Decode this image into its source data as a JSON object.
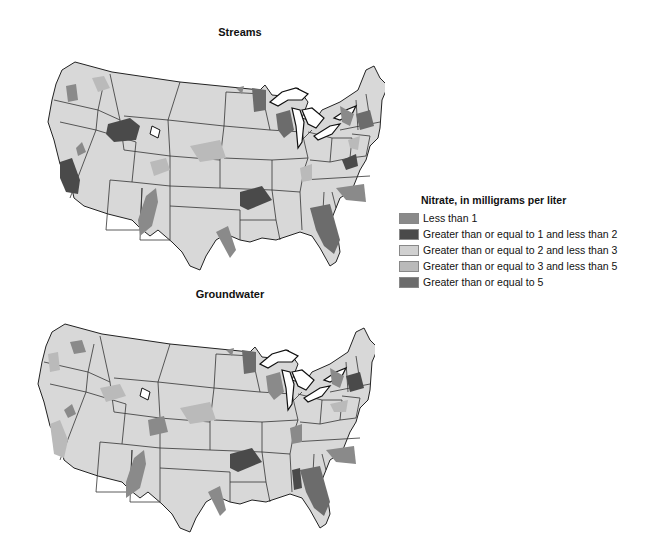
{
  "maps": [
    {
      "title": "Streams"
    },
    {
      "title": "Groundwater"
    }
  ],
  "legend": {
    "title": "Nitrate, in milligrams per liter",
    "items": [
      {
        "label": "Less than 1",
        "color": "#8a8a8a"
      },
      {
        "label": "Greater than or equal to 1 and less than 2",
        "color": "#4a4a4a"
      },
      {
        "label": "Greater than or equal to 2 and less than 3",
        "color": "#d0d0d0"
      },
      {
        "label": "Greater than or equal to 3 and less than 5",
        "color": "#bababa"
      },
      {
        "label": "Greater than or equal to 5",
        "color": "#6c6c6c"
      }
    ]
  },
  "colors": {
    "land": "#d8d8d8",
    "border": "#222222",
    "water": "#ffffff"
  }
}
